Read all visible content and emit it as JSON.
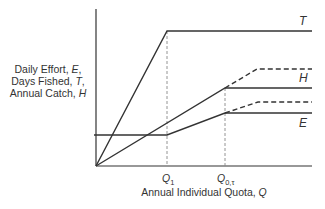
{
  "diagram": {
    "y_axis_label": {
      "lines": [
        {
          "text": "Daily Effort, ",
          "var": "E",
          "suffix": ","
        },
        {
          "text": "Days Fished, ",
          "var": "T",
          "suffix": ","
        },
        {
          "text": "Annual Catch, ",
          "var": "H",
          "suffix": ""
        }
      ]
    },
    "x_axis_label": {
      "text": "Annual Individual Quota, ",
      "var": "Q"
    },
    "ticks": [
      {
        "main": "Q",
        "sub": "1"
      },
      {
        "main": "Q",
        "sub": "0,τ"
      }
    ],
    "curves": [
      {
        "label": "T",
        "style": "solid"
      },
      {
        "label": "H",
        "style": "solid",
        "dashed_variant": true
      },
      {
        "label": "E",
        "style": "solid",
        "dashed_variant": true
      }
    ],
    "colors": {
      "line": "#333333",
      "guide": "#888888",
      "text": "#333333"
    }
  }
}
